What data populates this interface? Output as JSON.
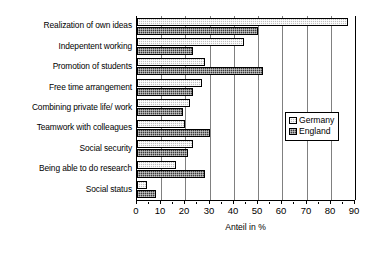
{
  "chart_data": {
    "type": "bar",
    "orientation": "horizontal",
    "title": "",
    "xlabel": "Anteil in %",
    "ylabel": "",
    "xlim": [
      0,
      90
    ],
    "xticks": [
      0,
      10,
      20,
      30,
      40,
      50,
      60,
      70,
      80,
      90
    ],
    "grid": true,
    "legend_position": "right-middle",
    "categories": [
      "Realization of own ideas",
      "Indepentent working",
      "Promotion of students",
      "Free time arrangement",
      "Combining private life/ work",
      "Teamwork with colleagues",
      "Social security",
      "Being able to do research",
      "Social status"
    ],
    "series": [
      {
        "name": "Germany",
        "values": [
          87,
          44,
          28,
          27,
          22,
          20,
          23,
          16,
          4
        ]
      },
      {
        "name": "England",
        "values": [
          50,
          23,
          52,
          23,
          19,
          30,
          21,
          28,
          8
        ]
      }
    ]
  },
  "legend": {
    "items": [
      {
        "label": "Germany",
        "swatch": "germany-swatch-icon"
      },
      {
        "label": "England",
        "swatch": "england-swatch-icon"
      }
    ]
  }
}
